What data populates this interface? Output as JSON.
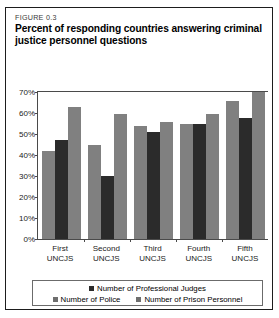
{
  "figure": {
    "number": "FIGURE 0.3",
    "title": "Percent of responding countries answering criminal justice personnel questions"
  },
  "chart_data": {
    "type": "bar",
    "title": "Percent of responding countries answering criminal justice personnel questions",
    "xlabel": "",
    "ylabel": "",
    "ylim": [
      0,
      70
    ],
    "grid": false,
    "legend_position": "bottom",
    "categories": [
      "First UNCJS",
      "Second UNCJS",
      "Third UNCJS",
      "Fourth UNCJS",
      "Fifth UNCJS"
    ],
    "category_lines": [
      [
        "First",
        "UNCJS"
      ],
      [
        "Second",
        "UNCJS"
      ],
      [
        "Third",
        "UNCJS"
      ],
      [
        "Fourth",
        "UNCJS"
      ],
      [
        "Fifth",
        "UNCJS"
      ]
    ],
    "ytick_labels": [
      "70%",
      "60%",
      "50%",
      "40%",
      "30%",
      "20%",
      "10%",
      "0%"
    ],
    "ytick_values": [
      70,
      60,
      50,
      40,
      30,
      20,
      10,
      0
    ],
    "series": [
      {
        "name": "Number of Police",
        "color": "#808080",
        "values": [
          42,
          45,
          54,
          55,
          65.5
        ]
      },
      {
        "name": "Number of Professional Judges",
        "color": "#2b2b2b",
        "values": [
          47,
          30,
          51,
          55,
          57.5
        ]
      },
      {
        "name": "Number of Prison Personnel",
        "color": "#808080",
        "values": [
          63,
          59.5,
          55.5,
          59.5,
          70
        ]
      }
    ]
  },
  "legend": {
    "row1": [
      {
        "label": "Number of Professional Judges",
        "color": "#2b2b2b"
      }
    ],
    "row2": [
      {
        "label": "Number of Police",
        "color": "#6e6e6e"
      },
      {
        "label": "Number of Prison Personnel",
        "color": "#6e6e6e"
      }
    ]
  }
}
